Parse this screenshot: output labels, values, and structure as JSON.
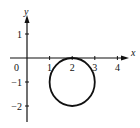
{
  "diagram": {
    "type": "coordinate-plot",
    "x_axis_label": "x",
    "y_axis_label": "y",
    "origin_label": "0",
    "x_ticks": [
      {
        "value": 1,
        "label": "1"
      },
      {
        "value": 2,
        "label": "2"
      },
      {
        "value": 3,
        "label": "3"
      },
      {
        "value": 4,
        "label": "4"
      }
    ],
    "y_ticks": [
      {
        "value": 1,
        "label": "1"
      },
      {
        "value": -1,
        "label": "−1"
      },
      {
        "value": -2,
        "label": "−2"
      }
    ],
    "x_range": [
      -0.7,
      4.5
    ],
    "y_range": [
      -2.6,
      1.8
    ],
    "circle": {
      "center": [
        2,
        -1
      ],
      "radius": 1
    },
    "colors": {
      "ink": "#111111",
      "background": "#ffffff"
    }
  }
}
